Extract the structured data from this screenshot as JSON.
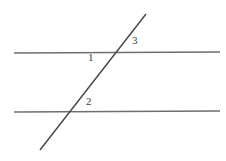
{
  "figure": {
    "background_color": "#ffffff",
    "width": 226,
    "height": 161,
    "parallel_line_color": "#6e6e6e",
    "transversal_color": "#444444",
    "label_color": "#3c3c3c",
    "lines": [
      {
        "name": "upper-parallel-line",
        "kind": "parallel",
        "x1": 14,
        "y1": 53,
        "x2": 220,
        "y2": 52,
        "stroke_width": 1.6
      },
      {
        "name": "lower-parallel-line",
        "kind": "parallel",
        "x1": 14,
        "y1": 112,
        "x2": 220,
        "y2": 111,
        "stroke_width": 1.6
      },
      {
        "name": "transversal-line",
        "kind": "transversal",
        "x1": 40,
        "y1": 150,
        "x2": 146,
        "y2": 14,
        "stroke_width": 1.4
      }
    ],
    "intersections": [
      {
        "name": "upper-intersection",
        "x": 116,
        "y": 53
      },
      {
        "name": "lower-intersection",
        "x": 70,
        "y": 112
      }
    ],
    "labels": [
      {
        "name": "angle-label-1",
        "text": "1",
        "x": 88,
        "y": 52
      },
      {
        "name": "angle-label-3",
        "text": "3",
        "x": 132,
        "y": 35
      },
      {
        "name": "angle-label-2",
        "text": "2",
        "x": 86,
        "y": 96
      }
    ]
  }
}
